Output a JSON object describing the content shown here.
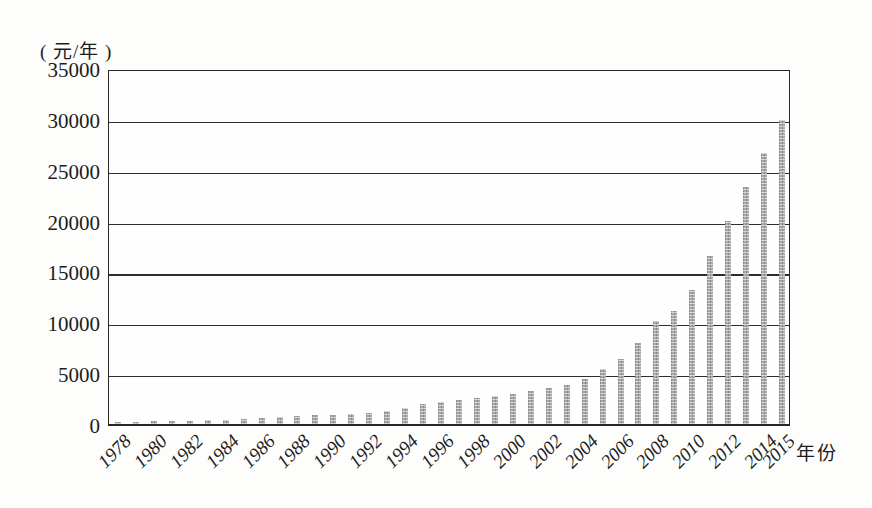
{
  "chart_data": {
    "type": "bar",
    "title": "",
    "unit_label": "( 元/年 )",
    "xlabel": "年份",
    "categories": [
      1978,
      1979,
      1980,
      1981,
      1982,
      1983,
      1984,
      1985,
      1986,
      1987,
      1988,
      1989,
      1990,
      1991,
      1992,
      1993,
      1994,
      1995,
      1996,
      1997,
      1998,
      1999,
      2000,
      2001,
      2002,
      2003,
      2004,
      2005,
      2006,
      2007,
      2008,
      2009,
      2010,
      2011,
      2012,
      2013,
      2014,
      2015
    ],
    "values": [
      150,
      200,
      250,
      300,
      330,
      370,
      420,
      500,
      570,
      660,
      780,
      860,
      920,
      1000,
      1100,
      1300,
      1600,
      1950,
      2200,
      2400,
      2600,
      2800,
      3000,
      3250,
      3500,
      3850,
      4400,
      5400,
      6400,
      8000,
      10100,
      11100,
      13200,
      16500,
      20000,
      23300,
      26600,
      29900
    ],
    "x_tick_labels": [
      "1978",
      "1980",
      "1982",
      "1984",
      "1986",
      "1988",
      "1990",
      "1992",
      "1994",
      "1996",
      "1998",
      "2000",
      "2002",
      "2004",
      "2006",
      "2008",
      "2010",
      "2012",
      "2014",
      "2015"
    ],
    "y_ticks": [
      0,
      5000,
      10000,
      15000,
      20000,
      25000,
      30000,
      35000
    ],
    "ylim": [
      0,
      35000
    ],
    "grid": true,
    "legend": "none",
    "bar_color": "#a9a9a9",
    "line_color": "#2e2e2e",
    "background_color": "#fdfdfc"
  }
}
